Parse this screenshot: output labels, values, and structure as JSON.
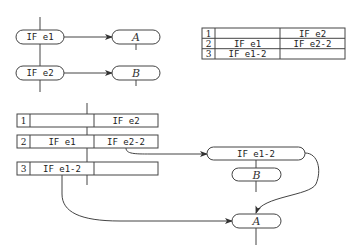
{
  "top_flow": {
    "nodes": [
      {
        "id": "if_e1",
        "label": "IF e1"
      },
      {
        "id": "a_top",
        "label": "A"
      },
      {
        "id": "if_e2",
        "label": "IF e2"
      },
      {
        "id": "b_top",
        "label": "B"
      }
    ],
    "edges": [
      {
        "from": "if_e1",
        "to": "a_top"
      },
      {
        "from": "if_e2",
        "to": "b_top"
      }
    ]
  },
  "right_table": {
    "rows": [
      {
        "num": "1",
        "col1": "",
        "col2": "IF e2"
      },
      {
        "num": "2",
        "col1": "IF e1",
        "col2": "IF e2-2"
      },
      {
        "num": "3",
        "col1": "IF e1-2",
        "col2": ""
      }
    ]
  },
  "bottom_flow": {
    "table_rows": [
      {
        "num": "1",
        "col1": "",
        "col2": "IF e2"
      },
      {
        "num": "2",
        "col1": "IF e1",
        "col2": "IF e2-2"
      },
      {
        "num": "3",
        "col1": "IF e1-2",
        "col2": ""
      }
    ],
    "nodes": [
      {
        "id": "if_e1_2",
        "label": "IF e1-2"
      },
      {
        "id": "b_bottom",
        "label": "B"
      },
      {
        "id": "a_bottom",
        "label": "A"
      }
    ],
    "edges": [
      {
        "from": "row2.col2",
        "to": "if_e1_2"
      },
      {
        "from": "if_e1_2",
        "to": "b_bottom"
      },
      {
        "from": "if_e1_2",
        "to": "a_bottom"
      },
      {
        "from": "row3.col1",
        "to": "a_bottom"
      }
    ]
  }
}
